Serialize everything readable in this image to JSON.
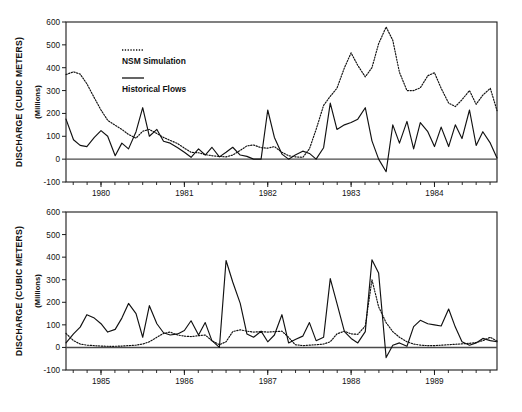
{
  "figure": {
    "title": "",
    "width": 522,
    "height": 412,
    "background": "#ffffff",
    "line_color": "#111111"
  },
  "axis": {
    "ylabel_main": "DISCHARGE (CUBIC METERS)",
    "ylabel_sub": "(Millions)",
    "xlabel": ""
  },
  "legend": {
    "position": "inside-top-left",
    "entries": [
      {
        "label": "NSM Simulation",
        "style": "dotted"
      },
      {
        "label": "Historical Flows",
        "style": "solid"
      }
    ]
  },
  "chart_data": [
    {
      "type": "line",
      "panel": "top",
      "title": "",
      "xlabel": "",
      "ylabel": "DISCHARGE (CUBIC METERS)",
      "ylabel_sub": "(Millions)",
      "ylim": [
        -100,
        600
      ],
      "yticks": [
        -100,
        0,
        100,
        200,
        300,
        400,
        500,
        600
      ],
      "ytick_labels": [
        "-100",
        "0",
        "100",
        "200",
        "300",
        "400",
        "500",
        "600"
      ],
      "xlim": [
        1979.58,
        1984.75
      ],
      "xticks": [
        1980,
        1981,
        1982,
        1983,
        1984
      ],
      "xtick_labels": [
        "1980",
        "1981",
        "1982",
        "1983",
        "1984"
      ],
      "minor_tick_interval_months": 2,
      "grid": false,
      "legend_position": "upper left inside",
      "series": [
        {
          "name": "Historical Flows",
          "style": "solid",
          "x": [
            1979.58,
            1979.67,
            1979.75,
            1979.83,
            1979.92,
            1980.0,
            1980.08,
            1980.17,
            1980.25,
            1980.33,
            1980.42,
            1980.5,
            1980.58,
            1980.67,
            1980.75,
            1980.83,
            1980.92,
            1981.0,
            1981.08,
            1981.17,
            1981.25,
            1981.33,
            1981.42,
            1981.5,
            1981.58,
            1981.67,
            1981.75,
            1981.83,
            1981.92,
            1982.0,
            1982.08,
            1982.17,
            1982.25,
            1982.33,
            1982.42,
            1982.5,
            1982.58,
            1982.67,
            1982.75,
            1982.83,
            1982.92,
            1983.0,
            1983.08,
            1983.17,
            1983.25,
            1983.33,
            1983.42,
            1983.5,
            1983.58,
            1983.67,
            1983.75,
            1983.83,
            1983.92,
            1984.0,
            1984.08,
            1984.17,
            1984.25,
            1984.33,
            1984.42,
            1984.5,
            1984.58,
            1984.67,
            1984.75
          ],
          "values": [
            175,
            85,
            60,
            55,
            95,
            125,
            100,
            15,
            70,
            45,
            120,
            225,
            100,
            130,
            78,
            70,
            50,
            30,
            8,
            45,
            18,
            52,
            10,
            30,
            52,
            18,
            12,
            0,
            0,
            215,
            95,
            22,
            0,
            18,
            35,
            25,
            0,
            50,
            245,
            130,
            150,
            160,
            175,
            225,
            80,
            0,
            -55,
            150,
            70,
            165,
            45,
            160,
            120,
            55,
            140,
            55,
            150,
            90,
            215,
            60,
            120,
            70,
            5
          ]
        },
        {
          "name": "NSM Simulation",
          "style": "dotted",
          "x": [
            1979.58,
            1979.67,
            1979.75,
            1979.83,
            1979.92,
            1980.0,
            1980.08,
            1980.17,
            1980.25,
            1980.33,
            1980.42,
            1980.5,
            1980.58,
            1980.67,
            1980.75,
            1980.83,
            1980.92,
            1981.0,
            1981.08,
            1981.17,
            1981.25,
            1981.33,
            1981.42,
            1981.5,
            1981.58,
            1981.67,
            1981.75,
            1981.83,
            1981.92,
            1982.0,
            1982.08,
            1982.17,
            1982.25,
            1982.33,
            1982.42,
            1982.5,
            1982.58,
            1982.67,
            1982.75,
            1982.83,
            1982.92,
            1983.0,
            1983.08,
            1983.17,
            1983.25,
            1983.33,
            1983.42,
            1983.5,
            1983.58,
            1983.67,
            1983.75,
            1983.83,
            1983.92,
            1984.0,
            1984.08,
            1984.17,
            1984.25,
            1984.33,
            1984.42,
            1984.5,
            1984.58,
            1984.67,
            1984.75
          ],
          "values": [
            370,
            382,
            372,
            330,
            268,
            215,
            170,
            148,
            130,
            108,
            92,
            122,
            130,
            112,
            95,
            82,
            68,
            48,
            30,
            28,
            20,
            15,
            12,
            10,
            18,
            38,
            58,
            62,
            50,
            48,
            55,
            30,
            15,
            10,
            8,
            45,
            130,
            235,
            275,
            310,
            400,
            465,
            410,
            360,
            400,
            505,
            578,
            520,
            380,
            300,
            300,
            312,
            365,
            378,
            310,
            245,
            230,
            260,
            300,
            240,
            280,
            310,
            212
          ]
        }
      ]
    },
    {
      "type": "line",
      "panel": "bottom",
      "title": "",
      "xlabel": "",
      "ylabel": "DISCHARGE (CUBIC METERS)",
      "ylabel_sub": "(Millions)",
      "ylim": [
        -100,
        600
      ],
      "yticks": [
        -100,
        0,
        100,
        200,
        300,
        400,
        500,
        600
      ],
      "ytick_labels": [
        "-100",
        "0",
        "100",
        "200",
        "300",
        "400",
        "500",
        "600"
      ],
      "xlim": [
        1984.58,
        1989.75
      ],
      "xticks": [
        1985,
        1986,
        1987,
        1988,
        1989
      ],
      "xtick_labels": [
        "1985",
        "1986",
        "1987",
        "1988",
        "1989"
      ],
      "minor_tick_interval_months": 2,
      "grid": false,
      "legend_position": "none",
      "series": [
        {
          "name": "Historical Flows",
          "style": "solid",
          "x": [
            1984.58,
            1984.67,
            1984.75,
            1984.83,
            1984.92,
            1985.0,
            1985.08,
            1985.17,
            1985.25,
            1985.33,
            1985.42,
            1985.5,
            1985.58,
            1985.67,
            1985.75,
            1985.83,
            1985.92,
            1986.0,
            1986.08,
            1986.17,
            1986.25,
            1986.33,
            1986.42,
            1986.5,
            1986.58,
            1986.67,
            1986.75,
            1986.83,
            1986.92,
            1987.0,
            1987.08,
            1987.17,
            1987.25,
            1987.33,
            1987.42,
            1987.5,
            1987.58,
            1987.67,
            1987.75,
            1987.83,
            1987.92,
            1988.0,
            1988.08,
            1988.17,
            1988.25,
            1988.33,
            1988.42,
            1988.5,
            1988.58,
            1988.67,
            1988.75,
            1988.83,
            1988.92,
            1989.0,
            1989.08,
            1989.17,
            1989.25,
            1989.33,
            1989.42,
            1989.5,
            1989.58,
            1989.67,
            1989.75
          ],
          "values": [
            20,
            60,
            90,
            145,
            130,
            105,
            68,
            80,
            130,
            195,
            150,
            45,
            185,
            105,
            65,
            55,
            60,
            75,
            118,
            55,
            110,
            30,
            0,
            385,
            290,
            195,
            60,
            45,
            72,
            25,
            55,
            145,
            20,
            35,
            50,
            110,
            30,
            45,
            305,
            195,
            70,
            40,
            20,
            70,
            388,
            330,
            -45,
            10,
            20,
            5,
            92,
            120,
            105,
            100,
            95,
            170,
            90,
            25,
            10,
            20,
            40,
            30,
            25
          ]
        },
        {
          "name": "NSM Simulation",
          "style": "dotted",
          "x": [
            1984.58,
            1984.67,
            1984.75,
            1984.83,
            1984.92,
            1985.0,
            1985.08,
            1985.17,
            1985.25,
            1985.33,
            1985.42,
            1985.5,
            1985.58,
            1985.67,
            1985.75,
            1985.83,
            1985.92,
            1986.0,
            1986.08,
            1986.17,
            1986.25,
            1986.33,
            1986.42,
            1986.5,
            1986.58,
            1986.67,
            1986.75,
            1986.83,
            1986.92,
            1987.0,
            1987.08,
            1987.17,
            1987.25,
            1987.33,
            1987.42,
            1987.5,
            1987.58,
            1987.67,
            1987.75,
            1987.83,
            1987.92,
            1988.0,
            1988.08,
            1988.17,
            1988.25,
            1988.33,
            1988.42,
            1988.5,
            1988.58,
            1988.67,
            1988.75,
            1988.83,
            1988.92,
            1989.0,
            1989.08,
            1989.17,
            1989.25,
            1989.33,
            1989.42,
            1989.5,
            1989.58,
            1989.67,
            1989.75
          ],
          "values": [
            62,
            30,
            15,
            10,
            8,
            6,
            5,
            5,
            6,
            8,
            10,
            15,
            25,
            45,
            62,
            68,
            55,
            50,
            48,
            52,
            55,
            30,
            12,
            25,
            70,
            78,
            72,
            68,
            70,
            68,
            70,
            72,
            45,
            12,
            8,
            10,
            12,
            15,
            25,
            60,
            72,
            60,
            58,
            95,
            300,
            180,
            110,
            70,
            45,
            25,
            15,
            10,
            8,
            8,
            10,
            12,
            14,
            16,
            18,
            22,
            30,
            45,
            28
          ]
        }
      ]
    }
  ]
}
